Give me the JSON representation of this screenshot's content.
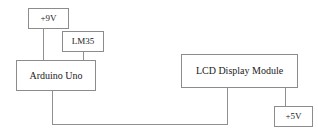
{
  "diagram": {
    "type": "block-diagram",
    "background_color": "#ffffff",
    "line_color": "#909090",
    "text_color": "#1a1a1a",
    "nodes": [
      {
        "id": "supply-9v",
        "label": "+9V",
        "role": "power-supply"
      },
      {
        "id": "lm35",
        "label": "LM35",
        "role": "temperature-sensor"
      },
      {
        "id": "arduino",
        "label": "Arduino Uno",
        "role": "microcontroller"
      },
      {
        "id": "lcd",
        "label": "LCD Display Module",
        "role": "display"
      },
      {
        "id": "supply-5v",
        "label": "+5V",
        "role": "power-supply"
      }
    ],
    "connections": [
      {
        "id": "9v-arduino",
        "from": "supply-9v",
        "to": "arduino",
        "shape": "vertical"
      },
      {
        "id": "lm35-arduino",
        "from": "lm35",
        "to": "arduino",
        "shape": "vertical"
      },
      {
        "id": "arduino-lcd",
        "from": "arduino",
        "to": "lcd",
        "shape": "orthogonal-down-right-up"
      },
      {
        "id": "lcd-5v",
        "from": "lcd",
        "to": "supply-5v",
        "shape": "vertical"
      }
    ]
  }
}
